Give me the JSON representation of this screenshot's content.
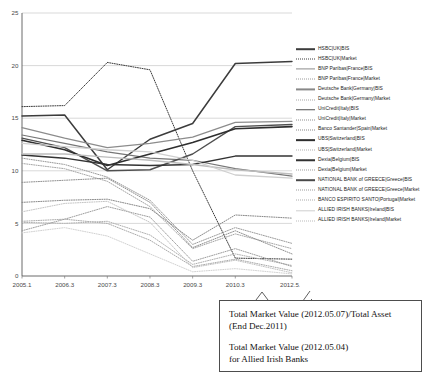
{
  "chart_data": {
    "type": "line",
    "title": "",
    "xlabel": "",
    "ylabel": "",
    "ylim": [
      0,
      25
    ],
    "yticks": [
      0,
      5,
      10,
      15,
      20,
      25
    ],
    "grid": true,
    "legend_position": "right",
    "x": [
      "2005.1",
      "2006.3",
      "2007.3",
      "2008.3",
      "2009.3",
      "2010.3",
      "2012.5.7"
    ],
    "series": [
      {
        "name": "HSBC|UK|BIS",
        "style": "solid",
        "color": "#3c3c3c",
        "width": 1.5,
        "values": [
          15.2,
          15.3,
          10.1,
          13.0,
          14.5,
          20.2,
          20.4
        ]
      },
      {
        "name": "HSBC|UK|Market",
        "style": "dotted",
        "color": "#3c3c3c",
        "width": 1.0,
        "values": [
          16.1,
          16.2,
          20.3,
          19.6,
          10.0,
          1.7,
          1.6
        ]
      },
      {
        "name": "BNP Paribas|France|BIS",
        "style": "solid",
        "color": "#8c8c8c",
        "width": 1.2,
        "values": [
          14.1,
          13.1,
          12.2,
          12.6,
          13.2,
          14.6,
          14.7
        ]
      },
      {
        "name": "BNP Paribas|France|Market",
        "style": "dotted",
        "color": "#9a9a9a",
        "width": 1.0,
        "values": [
          11.2,
          10.6,
          9.4,
          7.2,
          3.0,
          4.6,
          3.1
        ]
      },
      {
        "name": "Deutsche Bank|Germany|BIS",
        "style": "solid",
        "color": "#777777",
        "width": 1.2,
        "values": [
          13.4,
          12.6,
          11.8,
          11.2,
          11.0,
          10.2,
          9.5
        ]
      },
      {
        "name": "Deutsche Bank|Germany|Market",
        "style": "dotted",
        "color": "#a5a5a5",
        "width": 1.0,
        "values": [
          10.7,
          10.2,
          9.0,
          6.6,
          2.6,
          4.0,
          2.6
        ]
      },
      {
        "name": "UniCredit|Italy|BIS",
        "style": "solid",
        "color": "#4f4f4f",
        "width": 1.4,
        "values": [
          13.1,
          12.2,
          10.0,
          10.1,
          11.6,
          14.2,
          14.4
        ]
      },
      {
        "name": "UniCredit|Italy|Market",
        "style": "dotted",
        "color": "#8f8f8f",
        "width": 1.0,
        "values": [
          8.9,
          9.1,
          9.3,
          7.0,
          2.7,
          4.3,
          2.1
        ]
      },
      {
        "name": "Banco Santander|Spain|Market",
        "style": "dotted",
        "color": "#888888",
        "width": 1.0,
        "values": [
          7.0,
          7.2,
          7.3,
          6.4,
          3.4,
          5.8,
          5.5
        ]
      },
      {
        "name": "UBS|Switzerland|BIS",
        "style": "solid",
        "color": "#2e2e2e",
        "width": 1.6,
        "values": [
          12.9,
          12.0,
          10.5,
          11.6,
          12.7,
          14.0,
          14.2
        ]
      },
      {
        "name": "UBS|Switzerland|Market",
        "style": "dotted",
        "color": "#b0b0b0",
        "width": 1.0,
        "values": [
          5.1,
          5.0,
          5.2,
          3.9,
          1.1,
          2.1,
          1.0
        ]
      },
      {
        "name": "Dexia|Belgium|BIS",
        "style": "solid",
        "color": "#333333",
        "width": 1.4,
        "values": [
          11.5,
          11.2,
          10.6,
          10.5,
          10.6,
          11.4,
          11.4
        ]
      },
      {
        "name": "Dexia|Belgium|Market",
        "style": "dotted",
        "color": "#9e9e9e",
        "width": 1.0,
        "values": [
          4.3,
          5.4,
          6.6,
          5.6,
          1.4,
          2.6,
          0.9
        ]
      },
      {
        "name": "NATIONAL BANK of GREECE|Greece|BIS",
        "style": "solid",
        "color": "#bdbdbd",
        "width": 1.4,
        "values": [
          11.6,
          11.6,
          11.3,
          11.0,
          10.6,
          10.1,
          9.7
        ]
      },
      {
        "name": "NATIONAL BANK of GREECE|Greece|Market",
        "style": "dotted",
        "color": "#c4c4c4",
        "width": 1.0,
        "values": [
          6.1,
          6.9,
          7.1,
          5.1,
          0.8,
          1.5,
          0.3
        ]
      },
      {
        "name": "BANCO ESPIRITO SANTO|Portugal|Market",
        "style": "dotted",
        "color": "#ababab",
        "width": 1.0,
        "values": [
          5.2,
          5.4,
          5.0,
          3.4,
          0.9,
          1.6,
          0.5
        ]
      },
      {
        "name": "ALLIED IRISH BANKS|Ireland|BIS",
        "style": "solid",
        "color": "#cfcfcf",
        "width": 1.3,
        "values": [
          12.6,
          12.3,
          12.0,
          11.8,
          11.0,
          9.6,
          9.3
        ]
      },
      {
        "name": "ALLIED IRISH BANKS|Ireland|Market",
        "style": "dotted",
        "color": "#d2d2d2",
        "width": 1.0,
        "values": [
          4.1,
          4.6,
          3.8,
          2.1,
          0.4,
          0.7,
          0.2
        ]
      }
    ]
  },
  "legend": {
    "entries": [
      {
        "label": "HSBC|UK|BIS",
        "style": "solid",
        "color": "#3c3c3c",
        "width": 1.6
      },
      {
        "label": "HSBC|UK|Market",
        "style": "dotted",
        "color": "#3c3c3c",
        "width": 1.0
      },
      {
        "label": "BNP Paribas|France|BIS",
        "style": "solid",
        "color": "#8c8c8c",
        "width": 1.2
      },
      {
        "label": "BNP Paribas|France|Market",
        "style": "dotted",
        "color": "#9a9a9a",
        "width": 1.0
      },
      {
        "label": "Deutsche Bank|Germany|BIS",
        "style": "solid",
        "color": "#888888",
        "width": 1.2
      },
      {
        "label": "Deutsche Bank|Germany|Market",
        "style": "dotted",
        "color": "#a5a5a5",
        "width": 1.0
      },
      {
        "label": "UniCredit|Italy|BIS",
        "style": "solid",
        "color": "#4f4f4f",
        "width": 1.5
      },
      {
        "label": "UniCredit|Italy|Market",
        "style": "dotted",
        "color": "#8f8f8f",
        "width": 1.0
      },
      {
        "label": "Banco Santander|Spain|Market",
        "style": "dotted",
        "color": "#888888",
        "width": 1.0
      },
      {
        "label": "UBS|Switzerland|BIS",
        "style": "solid",
        "color": "#2e2e2e",
        "width": 1.7
      },
      {
        "label": "UBS|Switzerland|Market",
        "style": "dotted",
        "color": "#b0b0b0",
        "width": 1.0
      },
      {
        "label": "Dexia|Belgium|BIS",
        "style": "solid",
        "color": "#333333",
        "width": 1.5
      },
      {
        "label": "Dexia|Belgium|Market",
        "style": "dotted",
        "color": "#9e9e9e",
        "width": 1.0
      },
      {
        "label": "NATIONAL BANK of GREECE|Greece|BIS",
        "style": "solid",
        "color": "#4a4a4a",
        "width": 1.6
      },
      {
        "label": "NATIONAL BANK of GREECE|Greece|Market",
        "style": "dotted",
        "color": "#9c9c9c",
        "width": 1.0
      },
      {
        "label": "BANCO ESPIRITO SANTO|Portugal|Market",
        "style": "dotted",
        "color": "#ababab",
        "width": 1.0
      },
      {
        "label": "ALLIED IRISH BANKS|Ireland|BIS",
        "style": "solid",
        "color": "#cfcfcf",
        "width": 1.4
      },
      {
        "label": "ALLIED IRISH BANKS|Ireland|Market",
        "style": "dotted",
        "color": "#bcbcbc",
        "width": 1.0
      }
    ]
  },
  "annotation": {
    "line1": "Total Market Value (2012.05.07)/Total Asset",
    "line2": "(End Dec.2011)",
    "line3": "Total Market Value (2012.05.04)",
    "line4": "for Allied Irish Banks"
  }
}
